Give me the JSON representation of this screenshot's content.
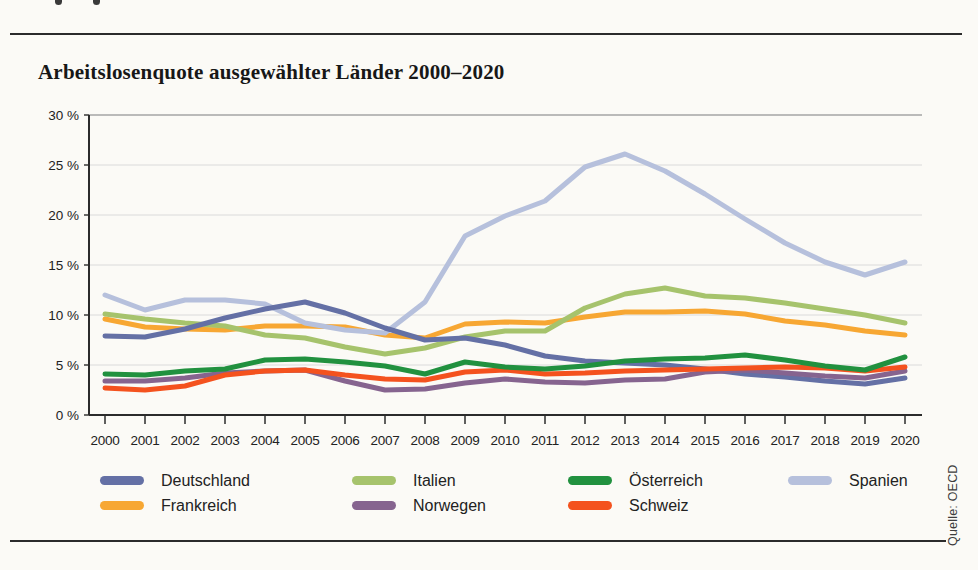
{
  "page": {
    "title": "Arbeitslosenquote ausgewählter Länder 2000–2020",
    "source": "Quelle: OECD"
  },
  "chart_data": {
    "type": "line",
    "title": "Arbeitslosenquote ausgewählter Länder 2000–2020",
    "ylabel": "Arbeitslosenquote in %",
    "xlabel": "Jahr",
    "grid": true,
    "legend_position": "bottom",
    "ylim": [
      0,
      30
    ],
    "ytick_values": [
      0,
      5,
      10,
      15,
      20,
      25,
      30
    ],
    "ytick_labels": [
      "0 %",
      "5 %",
      "10 %",
      "15 %",
      "20 %",
      "25 %",
      "30 %"
    ],
    "categories": [
      "2000",
      "2001",
      "2002",
      "2003",
      "2004",
      "2005",
      "2006",
      "2007",
      "2008",
      "2009",
      "2010",
      "2011",
      "2012",
      "2013",
      "2014",
      "2015",
      "2016",
      "2017",
      "2018",
      "2019",
      "2020"
    ],
    "series": [
      {
        "name": "Deutschland",
        "color": "#6470a5",
        "values": [
          7.9,
          7.8,
          8.6,
          9.7,
          10.6,
          11.3,
          10.2,
          8.7,
          7.5,
          7.7,
          7.0,
          5.9,
          5.4,
          5.2,
          5.0,
          4.6,
          4.1,
          3.8,
          3.4,
          3.1,
          3.7
        ]
      },
      {
        "name": "Frankreich",
        "color": "#f7a733",
        "values": [
          9.6,
          8.8,
          8.6,
          8.5,
          8.9,
          8.9,
          8.8,
          8.0,
          7.7,
          9.1,
          9.3,
          9.2,
          9.8,
          10.3,
          10.3,
          10.4,
          10.1,
          9.4,
          9.0,
          8.4,
          8.0
        ]
      },
      {
        "name": "Italien",
        "color": "#a6c36c",
        "values": [
          10.1,
          9.6,
          9.2,
          8.9,
          8.0,
          7.7,
          6.8,
          6.1,
          6.7,
          7.8,
          8.4,
          8.4,
          10.7,
          12.1,
          12.7,
          11.9,
          11.7,
          11.2,
          10.6,
          10.0,
          9.2
        ]
      },
      {
        "name": "Norwegen",
        "color": "#86648f",
        "values": [
          3.4,
          3.4,
          3.7,
          4.2,
          4.4,
          4.5,
          3.4,
          2.5,
          2.6,
          3.2,
          3.6,
          3.3,
          3.2,
          3.5,
          3.6,
          4.3,
          4.5,
          4.2,
          3.9,
          3.7,
          4.4
        ]
      },
      {
        "name": "Österreich",
        "color": "#21913f",
        "values": [
          4.1,
          4.0,
          4.4,
          4.6,
          5.5,
          5.6,
          5.3,
          4.9,
          4.1,
          5.3,
          4.8,
          4.6,
          4.9,
          5.4,
          5.6,
          5.7,
          6.0,
          5.5,
          4.9,
          4.5,
          5.8
        ]
      },
      {
        "name": "Schweiz",
        "color": "#f4521e",
        "values": [
          2.7,
          2.5,
          2.9,
          4.0,
          4.4,
          4.5,
          4.0,
          3.6,
          3.5,
          4.3,
          4.5,
          4.1,
          4.2,
          4.4,
          4.5,
          4.6,
          4.7,
          4.8,
          4.7,
          4.4,
          4.8
        ]
      },
      {
        "name": "Spanien",
        "color": "#b6c0dc",
        "values": [
          12.0,
          10.5,
          11.5,
          11.5,
          11.1,
          9.2,
          8.5,
          8.2,
          11.3,
          17.9,
          19.9,
          21.4,
          24.8,
          26.1,
          24.4,
          22.1,
          19.6,
          17.2,
          15.3,
          14.0,
          15.3
        ]
      }
    ],
    "draw_order": [
      "Frankreich",
      "Italien",
      "Spanien",
      "Deutschland",
      "Norwegen",
      "Schweiz",
      "Österreich"
    ],
    "legend_columns": [
      [
        "Deutschland",
        "Frankreich"
      ],
      [
        "Italien",
        "Norwegen"
      ],
      [
        "Österreich",
        "Schweiz"
      ],
      [
        "Spanien"
      ]
    ]
  }
}
